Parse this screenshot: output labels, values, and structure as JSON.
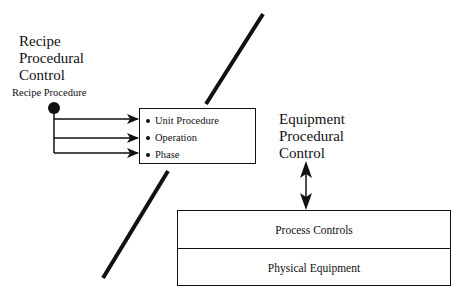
{
  "diagram": {
    "left_region_title": [
      "Recipe",
      "Procedural",
      "Control"
    ],
    "source_node_label": "Recipe Procedure",
    "procedure_box_items": [
      "Unit Procedure",
      "Operation",
      "Phase"
    ],
    "right_region_title": [
      "Equipment",
      "Procedural",
      "Control"
    ],
    "equipment_stack": [
      "Process Controls",
      "Physical Equipment"
    ],
    "colors": {
      "line": "#111111",
      "background": "#ffffff"
    }
  }
}
